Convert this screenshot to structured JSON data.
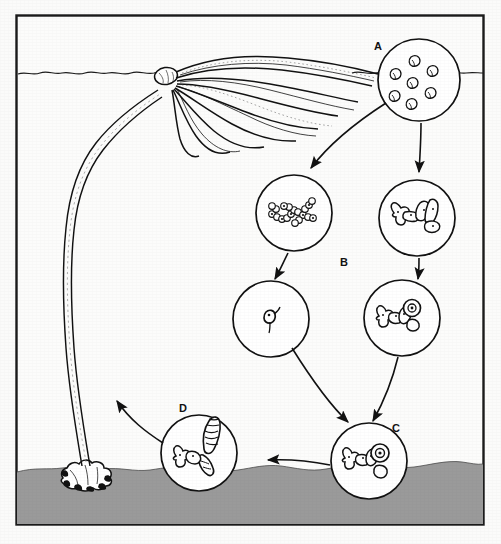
{
  "figure": {
    "domain_kind": "biology-life-cycle-diagram",
    "frame": {
      "border_color": "#1a1a1a",
      "background_color": "#fbfbfa",
      "x": 16,
      "y": 15,
      "width": 468,
      "height": 510
    },
    "environment": {
      "water_surface_label": "water surface line",
      "seafloor_color": "#9a9a9a",
      "seafloor_top_y": 462,
      "ink_color": "#111111"
    }
  },
  "labels": [
    {
      "id": "A",
      "text": "A",
      "x": 378,
      "y": 50,
      "describes": "zoospores released from sporangia"
    },
    {
      "id": "B",
      "text": "B",
      "x": 344,
      "y": 266,
      "describes": "gametophyte generation"
    },
    {
      "id": "C",
      "text": "C",
      "x": 396,
      "y": 432,
      "describes": "fertilized egg / zygote on female gametophyte"
    },
    {
      "id": "D",
      "text": "D",
      "x": 183,
      "y": 412,
      "describes": "young sporophyte growing from gametophyte"
    }
  ],
  "circles": [
    {
      "id": "circle-a",
      "label": "A",
      "cx": 419,
      "cy": 80,
      "r": 41,
      "content": "zoospores",
      "description": "Seven scattered flagellated zoospores released into the water"
    },
    {
      "id": "circle-male-gametophyte",
      "label": "",
      "cx": 294,
      "cy": 213,
      "r": 38,
      "content": "male-gametophyte",
      "description": "Branching chain of small beaded cells — male gametophyte filament"
    },
    {
      "id": "circle-female-gametophyte",
      "label": "",
      "cx": 417,
      "cy": 218,
      "r": 38,
      "content": "female-gametophyte",
      "description": "Short thick-celled filament — female gametophyte"
    },
    {
      "id": "circle-sperm",
      "label": "",
      "cx": 271,
      "cy": 319,
      "r": 38,
      "content": "sperm",
      "description": "A single small biflagellate sperm cell"
    },
    {
      "id": "circle-egg",
      "label": "",
      "cx": 402,
      "cy": 318,
      "r": 38,
      "content": "egg-on-gametophyte",
      "description": "Female gametophyte bearing an egg in the oogonium"
    },
    {
      "id": "circle-c",
      "label": "C",
      "cx": 369,
      "cy": 461,
      "r": 38,
      "content": "zygote",
      "description": "Fertilized egg (zygote) attached to female gametophyte on the seafloor"
    },
    {
      "id": "circle-d",
      "label": "D",
      "cx": 199,
      "cy": 453,
      "r": 38,
      "content": "young-sporophyte",
      "description": "Young striped sporophyte blade growing out of the gametophyte"
    }
  ],
  "arrows": [
    {
      "id": "arrow-a-to-male",
      "from": "circle-a",
      "to": "circle-male-gametophyte",
      "kind": "curved"
    },
    {
      "id": "arrow-a-to-female",
      "from": "circle-a",
      "to": "circle-female-gametophyte",
      "kind": "straight-down"
    },
    {
      "id": "arrow-male-to-sperm",
      "from": "circle-male-gametophyte",
      "to": "circle-sperm",
      "kind": "straight-down"
    },
    {
      "id": "arrow-female-to-egg",
      "from": "circle-female-gametophyte",
      "to": "circle-egg",
      "kind": "straight-down"
    },
    {
      "id": "arrow-sperm-to-c",
      "from": "circle-sperm",
      "to": "circle-c",
      "kind": "curved"
    },
    {
      "id": "arrow-egg-to-c",
      "from": "circle-egg",
      "to": "circle-c",
      "kind": "curved"
    },
    {
      "id": "arrow-c-to-d",
      "from": "circle-c",
      "to": "circle-d",
      "kind": "straight-left"
    },
    {
      "id": "arrow-d-to-adult",
      "from": "circle-d",
      "to": "adult-sporophyte",
      "kind": "curved-left"
    }
  ],
  "adult_sporophyte": {
    "id": "adult-sporophyte",
    "name": "adult kelp sporophyte",
    "parts": [
      "holdfast",
      "stipe",
      "blades",
      "float-bulb"
    ],
    "holdfast_x": 85,
    "holdfast_y": 470,
    "bulb_x": 158,
    "bulb_y": 75,
    "blade_count": 9
  }
}
